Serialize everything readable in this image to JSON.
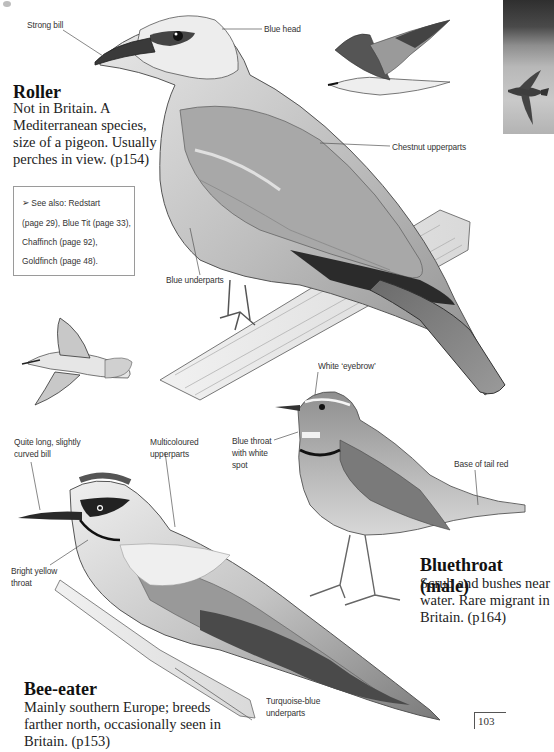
{
  "species": {
    "roller": {
      "name": "Roller",
      "description_lines": [
        "Not in Britain. A",
        "Mediterranean species,",
        "size of a pigeon. Usually",
        "perches in view. (p154)"
      ],
      "labels": {
        "bill": "Strong bill",
        "head": "Blue head",
        "upperparts": "Chestnut upperparts",
        "underparts": "Blue underparts"
      }
    },
    "bluethroat": {
      "name": "Bluethroat (male)",
      "description_lines": [
        "Scrub and bushes near",
        "water. Rare migrant in",
        "Britain. (p164)"
      ],
      "labels": {
        "eyebrow": "White ‘eyebrow’",
        "throat_lines": [
          "Blue throat",
          "with white",
          "spot"
        ],
        "tail": "Base of tail red"
      }
    },
    "bee_eater": {
      "name": "Bee-eater",
      "description_lines": [
        "Mainly southern Europe; breeds",
        "farther north, occasionally seen in",
        "Britain. (p153)"
      ],
      "labels": {
        "bill_lines": [
          "Quite long, slightly",
          "curved bill"
        ],
        "upperparts_lines": [
          "Multicoloured",
          "upperparts"
        ],
        "throat_lines": [
          "Bright yellow",
          "throat"
        ],
        "underparts_lines": [
          "Turquoise-blue",
          "underparts"
        ]
      }
    }
  },
  "see_also": {
    "icon": "arrow-bullet-icon",
    "lines": [
      "See also: Redstart",
      "(page 29), Blue Tit (page 33),",
      "Chaffinch (page 92),",
      "Goldfinch (page 48)."
    ]
  },
  "page_number": "103",
  "colors": {
    "background": "#ffffff",
    "text": "#1a1a1a",
    "label_text": "#333333",
    "box_border": "#9a9a9a",
    "leader_line": "#555555"
  }
}
